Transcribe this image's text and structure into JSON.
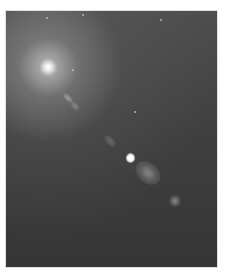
{
  "image": {
    "subject": "astronomical photograph of a galaxy core with an emerging jet",
    "tone": "grayscale",
    "colors": {
      "background": "#ffffff",
      "sky_top": "#4e4e4e",
      "sky_bottom": "#353535",
      "core": "#ffffff"
    }
  }
}
